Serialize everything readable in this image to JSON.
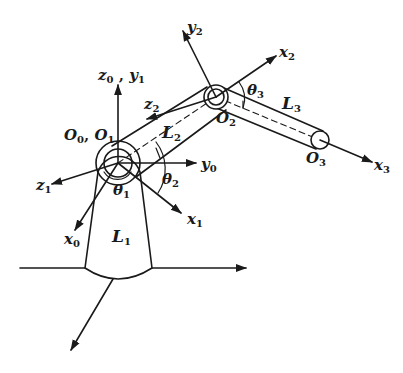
{
  "diagram": {
    "colors": {
      "ink": "#1a1a1a",
      "background": "#ffffff"
    },
    "labels": {
      "z0y1": {
        "base": "z",
        "sub": "0",
        "sep": " , ",
        "base2": "y",
        "sub2": "1"
      },
      "o0o1": {
        "base": "O",
        "sub": "0",
        "sep": ", ",
        "base2": "O",
        "sub2": "1"
      },
      "z1": {
        "base": "z",
        "sub": "1"
      },
      "x0": {
        "base": "x",
        "sub": "0"
      },
      "x1": {
        "base": "x",
        "sub": "1"
      },
      "y0": {
        "base": "y",
        "sub": "0"
      },
      "theta1": {
        "base": "θ",
        "sub": "1"
      },
      "theta2": {
        "base": "θ",
        "sub": "2"
      },
      "L1": {
        "base": "L",
        "sub": "1"
      },
      "L2": {
        "base": "L",
        "sub": "2"
      },
      "z2": {
        "base": "z",
        "sub": "2"
      },
      "y2": {
        "base": "y",
        "sub": "2"
      },
      "x2": {
        "base": "x",
        "sub": "2"
      },
      "theta3": {
        "base": "θ",
        "sub": "3"
      },
      "L3": {
        "base": "L",
        "sub": "3"
      },
      "O2": {
        "base": "O",
        "sub": "2"
      },
      "O3": {
        "base": "O",
        "sub": "3"
      },
      "x3": {
        "base": "x",
        "sub": "3"
      }
    },
    "joints": [
      {
        "name": "O0,O1",
        "cx": 118,
        "cy": 163
      },
      {
        "name": "O2",
        "cx": 216,
        "cy": 97
      },
      {
        "name": "O3",
        "cx": 320,
        "cy": 140
      }
    ]
  }
}
